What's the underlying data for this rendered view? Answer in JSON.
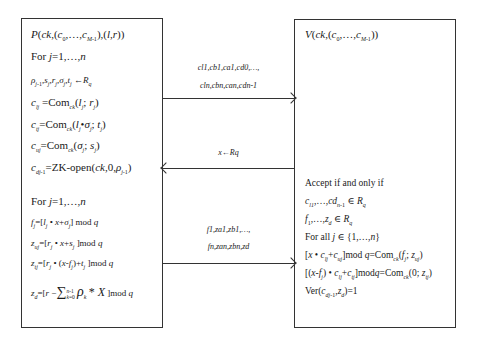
{
  "prover": {
    "title": "P(ck,(c0,…,cM-1),(l,r))",
    "lines": [
      "For j=1,…,n",
      "ρj-1,sj,rj,σj,tj ←Rq",
      "clj =Comck(lj; rj)",
      "ctj=Comck(lj•σj; tj)",
      "cuj=Comck(σj; sj)",
      "cdj-1=ZK-open(ck,0,ρj-1)",
      "For j=1,…,n",
      "fj=[lj • x+σj] mod q",
      "zuj=[rj • x+sj ]mod q",
      "ztj=[rj • (x-fj)+tj ]mod q",
      "zd=[r − ∑k=0..n-1 ρk * X ]mod q"
    ]
  },
  "verifier": {
    "title": "V(ck,(c0,…,cM-1))",
    "lines": [
      "Accept if and only if",
      "cl1,…,cdn-1 ∈ Rq",
      "f1,…,zd ∈ Rq",
      "For all j ∈ {1,…,n}",
      "[x • clj+cuj]mod q=Comck(fj; zuj)",
      "[(x-fj) • clj+ctj]modq=Comck(0; ztj)",
      "Ver(cdj-1,zd)=1"
    ]
  },
  "arrows": [
    {
      "direction": "right",
      "label_line1": "cl1,cb1,ca1,cd0,…,",
      "label_line2": "cln,cbn,can,cdn-1"
    },
    {
      "direction": "left",
      "label_line1": "x←Rq"
    },
    {
      "direction": "right",
      "label_line1": "f1,za1,zb1,…,",
      "label_line2": "fn,zan,zbn,zd"
    }
  ]
}
